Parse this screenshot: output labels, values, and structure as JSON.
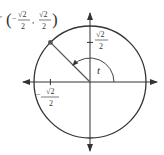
{
  "diagram": {
    "type": "unit-circle",
    "center": {
      "x": 90,
      "y": 82
    },
    "radius": 56,
    "colors": {
      "stroke": "#333333",
      "radius_line": "#555555",
      "point": "#555555",
      "background": "#ffffff"
    },
    "point_label": {
      "open_paren": "(",
      "x_sign": "−",
      "x_num": "√2",
      "x_den": "2",
      "comma": ",",
      "y_num": "√2",
      "y_den": "2",
      "close_paren": ")"
    },
    "y_tick_label": {
      "num": "√2",
      "den": "2"
    },
    "x_tick_label": {
      "sign": "−",
      "num": "√2",
      "den": "2"
    },
    "angle_label": "t",
    "angle_degrees": 135
  }
}
